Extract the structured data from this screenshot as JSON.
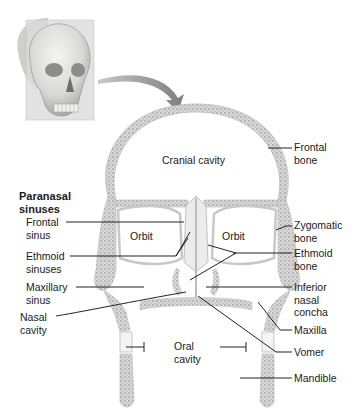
{
  "figure": {
    "inset": {
      "subject": "skull-3d-view",
      "plane": "coronal-section-plane"
    },
    "section_labels": {
      "cranial_cavity": "Cranial cavity",
      "orbit_left": "Orbit",
      "orbit_right": "Orbit",
      "oral_cavity_line1": "Oral",
      "oral_cavity_line2": "cavity"
    },
    "group_heading": {
      "line1": "Paranasal",
      "line2": "sinuses"
    },
    "left_labels": [
      {
        "line1": "Frontal",
        "line2": "sinus"
      },
      {
        "line1": "Ethmoid",
        "line2": "sinuses"
      },
      {
        "line1": "Maxillary",
        "line2": "sinus"
      },
      {
        "line1": "Nasal",
        "line2": "cavity"
      }
    ],
    "right_labels": [
      {
        "line1": "Frontal",
        "line2": "bone"
      },
      {
        "line1": "Zygomatic",
        "line2": "bone"
      },
      {
        "line1": "Ethmoid",
        "line2": "bone"
      },
      {
        "line1": "Inferior",
        "line2": "nasal",
        "line3": "concha"
      },
      {
        "line1": "Maxilla"
      },
      {
        "line1": "Vomer"
      },
      {
        "line1": "Mandible"
      }
    ],
    "colors": {
      "bone_fill": "#e6e6e6",
      "bone_stipple": "#8a8a8a",
      "leader_line": "#222222",
      "arrow": "#8c8c8c",
      "plane": "#d9d9d9"
    }
  }
}
